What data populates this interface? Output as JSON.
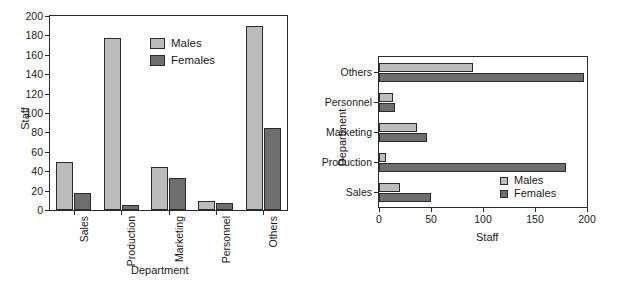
{
  "figure": {
    "panels": [
      {
        "id": "panel-vertical",
        "name": "vertical-bar-chart"
      },
      {
        "id": "panel-horizontal",
        "name": "horizontal-bar-chart"
      }
    ]
  },
  "legend": {
    "males_label": "Males",
    "females_label": "Females"
  },
  "colors": {
    "males": "#bcbcbc",
    "females": "#6e6e6e",
    "axis": "#2b2b2b",
    "background": "#ffffff"
  },
  "vertical_chart": {
    "xlabel": "Department",
    "ylabel": "Staff",
    "ytick_labels": [
      "0",
      "20",
      "40",
      "60",
      "80",
      "100",
      "120",
      "140",
      "160",
      "180",
      "200"
    ],
    "categories": [
      "Sales",
      "Production",
      "Marketing",
      "Personnel",
      "Others"
    ]
  },
  "horizontal_chart": {
    "xlabel": "Staff",
    "ylabel": "Department",
    "xtick_labels": [
      "0",
      "50",
      "100",
      "150",
      "200"
    ],
    "categories": [
      "Sales",
      "Production",
      "Marketing",
      "Personnel",
      "Others"
    ]
  },
  "chart_data": [
    {
      "type": "bar",
      "orientation": "vertical",
      "title": "",
      "xlabel": "Department",
      "ylabel": "Staff",
      "categories": [
        "Sales",
        "Production",
        "Marketing",
        "Personnel",
        "Others"
      ],
      "series": [
        {
          "name": "Males",
          "color": "#bcbcbc",
          "values": [
            50,
            177,
            44,
            9,
            190
          ]
        },
        {
          "name": "Females",
          "color": "#6e6e6e",
          "values": [
            18,
            5,
            33,
            7,
            85
          ]
        }
      ],
      "ylim": [
        0,
        200
      ],
      "yticks": [
        0,
        20,
        40,
        60,
        80,
        100,
        120,
        140,
        160,
        180,
        200
      ],
      "grid": false,
      "legend_position": "upper-center"
    },
    {
      "type": "bar",
      "orientation": "horizontal",
      "title": "",
      "xlabel": "Staff",
      "ylabel": "Department",
      "categories": [
        "Sales",
        "Production",
        "Marketing",
        "Personnel",
        "Others"
      ],
      "series": [
        {
          "name": "Males",
          "color": "#bcbcbc",
          "values": [
            20,
            7,
            37,
            13,
            90
          ]
        },
        {
          "name": "Females",
          "color": "#6e6e6e",
          "values": [
            50,
            180,
            46,
            15,
            197
          ]
        }
      ],
      "xlim": [
        0,
        200
      ],
      "xticks": [
        0,
        50,
        100,
        150,
        200
      ],
      "grid": false,
      "legend_position": "lower-right"
    }
  ]
}
